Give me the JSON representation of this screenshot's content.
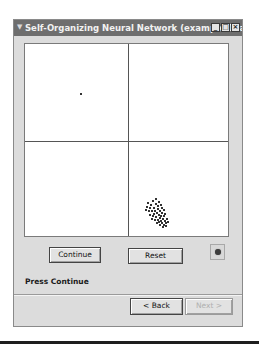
{
  "window": {
    "title": "Self-Organizing Neural Network (example 10ax)",
    "title_icon": "app-icon",
    "controls": {
      "minimize": "_",
      "maximize": "□",
      "close": "×"
    }
  },
  "canvas": {
    "quadrants": 4,
    "single_point": {
      "x": 55,
      "y": 49
    },
    "cluster_quadrant": "bottom-right",
    "cluster_points": [
      [
        122,
        158
      ],
      [
        125,
        160
      ],
      [
        127,
        156
      ],
      [
        130,
        159
      ],
      [
        132,
        161
      ],
      [
        128,
        163
      ],
      [
        124,
        163
      ],
      [
        126,
        166
      ],
      [
        129,
        166
      ],
      [
        132,
        164
      ],
      [
        134,
        166
      ],
      [
        131,
        168
      ],
      [
        128,
        169
      ],
      [
        133,
        170
      ],
      [
        136,
        168
      ],
      [
        135,
        171
      ],
      [
        130,
        172
      ],
      [
        134,
        173
      ],
      [
        137,
        174
      ],
      [
        132,
        175
      ],
      [
        135,
        176
      ],
      [
        138,
        171
      ],
      [
        139,
        176
      ],
      [
        136,
        178
      ],
      [
        133,
        177
      ],
      [
        129,
        175
      ],
      [
        127,
        171
      ],
      [
        123,
        166
      ],
      [
        121,
        162
      ],
      [
        138,
        180
      ],
      [
        140,
        178
      ],
      [
        137,
        182
      ],
      [
        134,
        180
      ],
      [
        131,
        178
      ],
      [
        126,
        174
      ],
      [
        124,
        170
      ],
      [
        120,
        165
      ],
      [
        141,
        174
      ],
      [
        139,
        169
      ],
      [
        136,
        163
      ],
      [
        133,
        157
      ],
      [
        130,
        154
      ],
      [
        135,
        160
      ],
      [
        138,
        165
      ],
      [
        140,
        181
      ],
      [
        142,
        177
      ]
    ]
  },
  "controls": {
    "continue_label": "Continue",
    "reset_label": "Reset",
    "status_icon": "status-light-icon"
  },
  "status": {
    "text": "Press Continue"
  },
  "nav": {
    "back_label": "< Back",
    "next_label": "Next >",
    "next_enabled": false
  }
}
